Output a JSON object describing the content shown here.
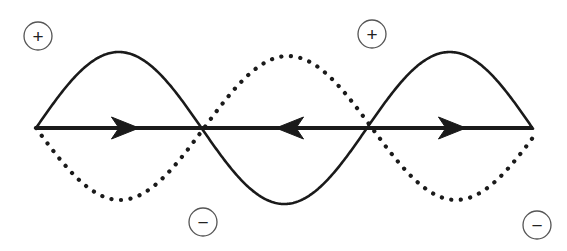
{
  "figure": {
    "background_color": "#ffffff",
    "width": 567,
    "height": 251
  },
  "axis": {
    "name": "horizontal-axis",
    "color": "#1a1a1a",
    "stroke_width": 4,
    "y": 128,
    "x_start": 36,
    "x_end": 533,
    "arrows": [
      {
        "label": "arrow-right-1",
        "x": 122,
        "direction": "right"
      },
      {
        "label": "arrow-left-1",
        "x": 293,
        "direction": "left"
      },
      {
        "label": "arrow-right-2",
        "x": 449,
        "direction": "right"
      }
    ],
    "arrow_half_length": 17,
    "arrow_half_width": 11
  },
  "curves": [
    {
      "name": "solid-wave",
      "style": "solid",
      "color": "#1a1a1a",
      "stroke_width": 2.6,
      "dash_pattern": "",
      "amplitude": 76,
      "baseline_y": 128,
      "x_start": 36,
      "x_end": 533,
      "wavelength": 331,
      "phase_deg": 0,
      "peaks": [
        {
          "x": 125,
          "y": 52
        },
        {
          "x": 455,
          "y": 52
        }
      ],
      "troughs": [
        {
          "x": 290,
          "y": 203
        }
      ],
      "zero_crossings": [
        36,
        208,
        373,
        533
      ]
    },
    {
      "name": "dotted-wave",
      "style": "dotted",
      "color": "#1a1a1a",
      "stroke_width": 4.2,
      "dash_pattern": "0.1 9.5",
      "amplitude": 72,
      "baseline_y": 128,
      "x_start": 36,
      "x_end": 533,
      "wavelength": 336,
      "phase_deg": 180,
      "peaks": [
        {
          "x": 373,
          "y": 55
        }
      ],
      "troughs": [
        {
          "x": 205,
          "y": 200
        }
      ],
      "zero_crossings": [
        122,
        290,
        449
      ],
      "start_point": {
        "x": 36,
        "y": 58
      },
      "end_point": {
        "x": 533,
        "y": 213
      }
    }
  ],
  "markers": [
    {
      "name": "polarity-plus-left",
      "symbol": "+",
      "sign": "positive",
      "cx": 38,
      "cy": 36,
      "radius": 14,
      "stroke_color": "#555555",
      "text_color": "#222222"
    },
    {
      "name": "polarity-minus-left",
      "symbol": "−",
      "sign": "negative",
      "cx": 203,
      "cy": 222,
      "radius": 14,
      "stroke_color": "#555555",
      "text_color": "#222222"
    },
    {
      "name": "polarity-plus-right",
      "symbol": "+",
      "sign": "positive",
      "cx": 372,
      "cy": 34,
      "radius": 14,
      "stroke_color": "#555555",
      "text_color": "#222222"
    },
    {
      "name": "polarity-minus-right",
      "symbol": "−",
      "sign": "negative",
      "cx": 537,
      "cy": 225,
      "radius": 14,
      "stroke_color": "#555555",
      "text_color": "#222222"
    }
  ]
}
